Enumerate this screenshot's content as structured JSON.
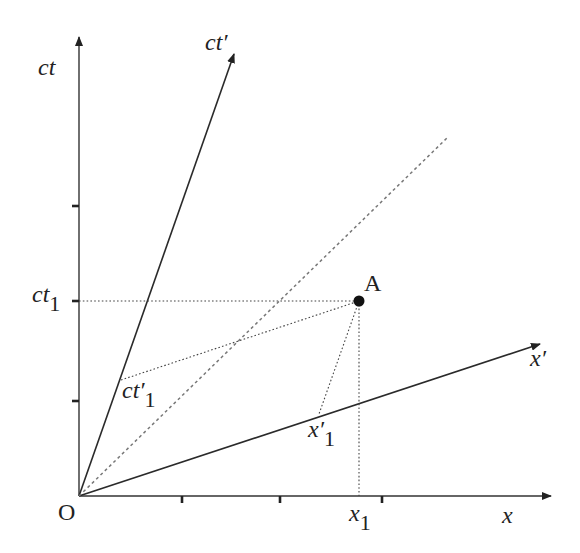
{
  "diagram": {
    "type": "minkowski-spacetime-diagram",
    "origin_label": "O",
    "axes": {
      "ct": {
        "label": "ct"
      },
      "x": {
        "label": "x"
      },
      "ct_prime": {
        "label": "ct",
        "prime": "′"
      },
      "x_prime": {
        "label": "x",
        "prime": "′"
      }
    },
    "event": {
      "label": "A"
    },
    "projections": {
      "ct1": {
        "label": "ct",
        "sub": "1"
      },
      "x1": {
        "label": "x",
        "sub": "1"
      },
      "ct_prime_1": {
        "label": "ct",
        "prime": "′",
        "sub": "1"
      },
      "x_prime_1": {
        "label": "x",
        "prime": "′",
        "sub": "1"
      }
    },
    "light_line": {
      "description": "45° dashed line (x = ct)"
    },
    "ticks": {
      "x_count": 3,
      "ct_count": 3
    },
    "colors": {
      "axis": "#333333",
      "light_line": "#777777",
      "event_dot": "#111111",
      "background": "#ffffff"
    }
  }
}
